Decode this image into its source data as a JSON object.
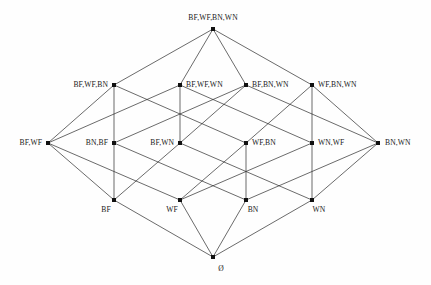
{
  "diagram": {
    "kind": "hasse-diagram",
    "title": "",
    "background_color": "#fefefe",
    "line_color": "#2b2b2b",
    "node_color": "#111111",
    "text_color": "#1a1a1a",
    "nodes": [
      {
        "id": "top",
        "label": "BF,WF,BN,WN",
        "x": 213,
        "y": 29,
        "label_x": 213,
        "label_y": 20,
        "anchor": "mid"
      },
      {
        "id": "bfwfbn",
        "label": "BF,WF,BN",
        "x": 114,
        "y": 85,
        "label_x": 108,
        "label_y": 87,
        "anchor": "end"
      },
      {
        "id": "bfwfwn",
        "label": "BF,WF,WN",
        "x": 180,
        "y": 85,
        "label_x": 186,
        "label_y": 87,
        "anchor": "start"
      },
      {
        "id": "bfbnwn",
        "label": "BF,BN,WN",
        "x": 246,
        "y": 85,
        "label_x": 252,
        "label_y": 87,
        "anchor": "start"
      },
      {
        "id": "wfbnwn",
        "label": "WF,BN,WN",
        "x": 312,
        "y": 85,
        "label_x": 318,
        "label_y": 87,
        "anchor": "start"
      },
      {
        "id": "bfwf",
        "label": "BF,WF",
        "x": 48,
        "y": 143,
        "label_x": 42,
        "label_y": 145,
        "anchor": "end"
      },
      {
        "id": "bnbf",
        "label": "BN,BF",
        "x": 114,
        "y": 143,
        "label_x": 108,
        "label_y": 145,
        "anchor": "end"
      },
      {
        "id": "bfwn",
        "label": "BF,WN",
        "x": 180,
        "y": 143,
        "label_x": 174,
        "label_y": 145,
        "anchor": "end"
      },
      {
        "id": "wfbn",
        "label": "WF,BN",
        "x": 246,
        "y": 143,
        "label_x": 252,
        "label_y": 145,
        "anchor": "start"
      },
      {
        "id": "wnwf",
        "label": "WN,WF",
        "x": 312,
        "y": 143,
        "label_x": 318,
        "label_y": 145,
        "anchor": "start"
      },
      {
        "id": "bnwn",
        "label": "BN,WN",
        "x": 378,
        "y": 143,
        "label_x": 385,
        "label_y": 145,
        "anchor": "start"
      },
      {
        "id": "bf",
        "label": "BF",
        "x": 114,
        "y": 200,
        "label_x": 106,
        "label_y": 212,
        "anchor": "mid"
      },
      {
        "id": "wf",
        "label": "WF",
        "x": 180,
        "y": 200,
        "label_x": 172,
        "label_y": 212,
        "anchor": "mid"
      },
      {
        "id": "bn",
        "label": "BN",
        "x": 246,
        "y": 200,
        "label_x": 253,
        "label_y": 212,
        "anchor": "mid"
      },
      {
        "id": "wn",
        "label": "WN",
        "x": 312,
        "y": 200,
        "label_x": 319,
        "label_y": 212,
        "anchor": "mid"
      },
      {
        "id": "empty",
        "label": "Ø",
        "x": 213,
        "y": 257,
        "label_x": 221,
        "label_y": 271,
        "anchor": "mid"
      }
    ],
    "edges": [
      {
        "from": "top",
        "to": "bfwfbn"
      },
      {
        "from": "top",
        "to": "bfwfwn"
      },
      {
        "from": "top",
        "to": "bfbnwn"
      },
      {
        "from": "top",
        "to": "wfbnwn"
      },
      {
        "from": "bfwfbn",
        "to": "bfwf"
      },
      {
        "from": "bfwfbn",
        "to": "bnbf"
      },
      {
        "from": "bfwfbn",
        "to": "wfbn"
      },
      {
        "from": "bfwfwn",
        "to": "bfwf"
      },
      {
        "from": "bfwfwn",
        "to": "bfwn"
      },
      {
        "from": "bfwfwn",
        "to": "wnwf"
      },
      {
        "from": "bfbnwn",
        "to": "bnbf"
      },
      {
        "from": "bfbnwn",
        "to": "bfwn"
      },
      {
        "from": "bfbnwn",
        "to": "bnwn"
      },
      {
        "from": "wfbnwn",
        "to": "wfbn"
      },
      {
        "from": "wfbnwn",
        "to": "wnwf"
      },
      {
        "from": "wfbnwn",
        "to": "bnwn"
      },
      {
        "from": "bfwf",
        "to": "bf"
      },
      {
        "from": "bfwf",
        "to": "wf"
      },
      {
        "from": "bnbf",
        "to": "bf"
      },
      {
        "from": "bnbf",
        "to": "bn"
      },
      {
        "from": "bfwn",
        "to": "bf"
      },
      {
        "from": "bfwn",
        "to": "wn"
      },
      {
        "from": "wfbn",
        "to": "wf"
      },
      {
        "from": "wfbn",
        "to": "bn"
      },
      {
        "from": "wnwf",
        "to": "wf"
      },
      {
        "from": "wnwf",
        "to": "wn"
      },
      {
        "from": "bnwn",
        "to": "bn"
      },
      {
        "from": "bnwn",
        "to": "wn"
      },
      {
        "from": "bf",
        "to": "empty"
      },
      {
        "from": "wf",
        "to": "empty"
      },
      {
        "from": "bn",
        "to": "empty"
      },
      {
        "from": "wn",
        "to": "empty"
      }
    ]
  }
}
